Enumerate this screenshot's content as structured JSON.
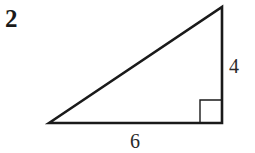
{
  "question": {
    "number": "2"
  },
  "diagram": {
    "shape": "right-triangle",
    "right_angle_marker": "bottom-right",
    "sides": {
      "vertical": {
        "label": "4"
      },
      "horizontal": {
        "label": "6"
      },
      "hypotenuse": {
        "label": ""
      }
    },
    "stroke_color": "#1a1a1a"
  }
}
